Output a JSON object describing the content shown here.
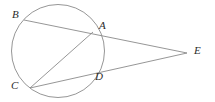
{
  "figure": {
    "type": "circle-geometry-diagram",
    "background_color": "#ffffff",
    "stroke_color": "#8a8a8a",
    "label_color": "#2b2b2b",
    "labels": {
      "a": "A",
      "b": "B",
      "c": "C",
      "d": "D",
      "e": "E"
    },
    "circle": {
      "cx": 58,
      "cy": 51,
      "r": 46.5
    },
    "points": {
      "A": {
        "x": 93,
        "y": 32
      },
      "B": {
        "x": 24,
        "y": 20
      },
      "C": {
        "x": 30,
        "y": 88
      },
      "D": {
        "x": 90,
        "y": 70
      },
      "E": {
        "x": 187,
        "y": 53
      }
    },
    "label_positions": {
      "A": {
        "x": 99,
        "y": 20
      },
      "B": {
        "x": 12,
        "y": 9
      },
      "C": {
        "x": 11,
        "y": 80
      },
      "D": {
        "x": 95,
        "y": 71
      },
      "E": {
        "x": 194,
        "y": 45
      }
    },
    "segments": [
      {
        "name": "secant-B-E",
        "from": "B",
        "to": "E"
      },
      {
        "name": "secant-C-E",
        "from": "C",
        "to": "E"
      },
      {
        "name": "chord-C-A",
        "from": "C",
        "to": "A"
      }
    ]
  }
}
